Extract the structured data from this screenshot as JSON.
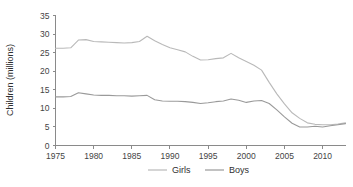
{
  "chart_data": {
    "type": "line",
    "title": "",
    "xlabel": "",
    "ylabel": "Children (millions)",
    "xlim": [
      1975,
      2013
    ],
    "ylim": [
      0,
      35
    ],
    "grid": false,
    "legend_position": "bottom-center",
    "x_ticks": [
      1975,
      1980,
      1985,
      1990,
      1995,
      2000,
      2005,
      2010
    ],
    "y_ticks": [
      0,
      5,
      10,
      15,
      20,
      25,
      30,
      35
    ],
    "x": [
      1975,
      1976,
      1977,
      1978,
      1979,
      1980,
      1981,
      1982,
      1983,
      1984,
      1985,
      1986,
      1987,
      1988,
      1989,
      1990,
      1991,
      1992,
      1993,
      1994,
      1995,
      1996,
      1997,
      1998,
      1999,
      2000,
      2001,
      2002,
      2003,
      2004,
      2005,
      2006,
      2007,
      2008,
      2009,
      2010,
      2011,
      2012,
      2013
    ],
    "series": [
      {
        "name": "Girls",
        "color": "#b9b9b9",
        "values": [
          26.2,
          26.2,
          26.3,
          28.4,
          28.5,
          28.0,
          27.9,
          27.8,
          27.7,
          27.6,
          27.7,
          28.0,
          29.4,
          28.2,
          27.2,
          26.3,
          25.8,
          25.2,
          24.0,
          23.0,
          23.1,
          23.4,
          23.6,
          24.8,
          23.6,
          22.6,
          21.6,
          20.3,
          17.0,
          13.9,
          11.2,
          8.8,
          7.3,
          6.1,
          5.7,
          5.6,
          5.6,
          5.8,
          6.1
        ]
      },
      {
        "name": "Boys",
        "color": "#9a9a9a",
        "values": [
          13.1,
          13.1,
          13.2,
          14.2,
          13.9,
          13.6,
          13.5,
          13.5,
          13.4,
          13.4,
          13.3,
          13.4,
          13.5,
          12.3,
          12.0,
          11.9,
          11.9,
          11.8,
          11.6,
          11.3,
          11.5,
          11.8,
          12.0,
          12.5,
          12.2,
          11.6,
          12.0,
          12.1,
          11.3,
          9.6,
          7.7,
          6.0,
          5.0,
          5.0,
          5.2,
          5.0,
          5.3,
          5.6,
          5.9
        ]
      }
    ]
  },
  "legend": {
    "items": [
      {
        "label": "Girls"
      },
      {
        "label": "Boys"
      }
    ]
  },
  "axes": {
    "y_title": "Children (millions)"
  }
}
